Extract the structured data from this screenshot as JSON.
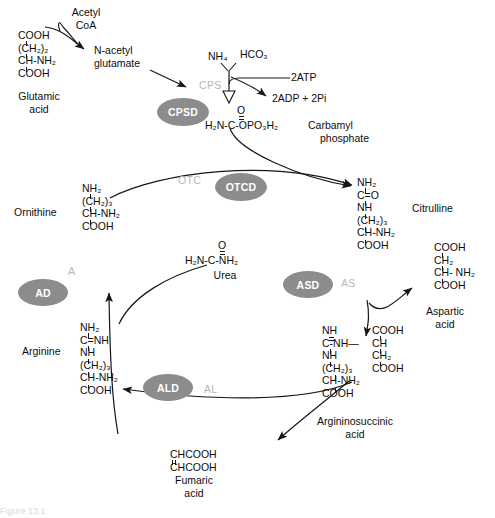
{
  "figure": {
    "caption_partial": "Figure 13.1"
  },
  "colors": {
    "enzyme_pill_fill": "#8c8c8c",
    "enzyme_pill_text": "#ffffff",
    "enzyme_plain_text": "#b6b6b6",
    "ink": "#0d0d0d",
    "background": "#ffffff"
  },
  "metabolites": {
    "acetyl_coa": {
      "line1": "Acetyl",
      "line2": "CoA"
    },
    "glutamic_acid": {
      "name_line1": "Glutamic",
      "name_line2": "acid",
      "formula": [
        "COOH",
        "(CH2)2",
        "CH-NH2",
        "COOH"
      ],
      "formula_display": [
        "COOH",
        "(CH₂)₂",
        "CH-NH₂",
        "COOH"
      ]
    },
    "n_acetyl_glutamate": {
      "line1": "N-acetyl",
      "line2": "glutamate"
    },
    "ammonium": "NH4",
    "ammonium_display": "NH₄",
    "bicarbonate": "HCO3",
    "bicarbonate_display": "HCO₃",
    "atp_in": "2ATP",
    "adp_pi_out": "2ADP + 2Pi",
    "carbamyl_phosphate": {
      "name_line1": "Carbamyl",
      "name_line2": "phosphate",
      "top_atom": "O",
      "formula": "H2N-C-OPO3H2",
      "formula_display": "H₂N-C-OPO₃H₂"
    },
    "ornithine": {
      "name": "Ornithine",
      "formula": [
        "NH2",
        "(CH2)3",
        "CH-NH2",
        "COOH"
      ],
      "formula_display": [
        "NH₂",
        "(CH₂)₃",
        "CH-NH₂",
        "COOH"
      ]
    },
    "citrulline": {
      "name": "Citrulline",
      "formula": [
        "NH2",
        "C=O",
        "NH",
        "(CH2)3",
        "CH-NH2",
        "COOH"
      ],
      "formula_display": [
        "NH₂",
        "C=O",
        "NH",
        "(CH₂)₃",
        "CH-NH₂",
        "COOH"
      ]
    },
    "urea": {
      "name": "Urea",
      "top_atom": "O",
      "formula": "H2N-C-NH2",
      "formula_display": "H₂N-C-NH₂"
    },
    "aspartic_acid": {
      "name_line1": "Aspartic",
      "name_line2": "acid",
      "formula": [
        "COOH",
        "CH2",
        "CH- NH2",
        "COOH"
      ],
      "formula_display": [
        "COOH",
        "CH₂",
        "CH- NH₂",
        "COOH"
      ]
    },
    "arginine": {
      "name": "Arginine",
      "formula": [
        "NH2",
        "C=NH",
        "NH",
        "(CH2)3",
        "CH-NH2",
        "COOH"
      ],
      "formula_display": [
        "NH₂",
        "C=NH",
        "NH",
        "(CH₂)₃",
        "CH-NH₂",
        "COOH"
      ]
    },
    "argininosuccinic_acid": {
      "name_line1": "Argininosuccinic",
      "name_line2": "acid",
      "left_column": [
        "NH",
        "C-NH—",
        "NH",
        "(CH2)3",
        "CH-NH2",
        "COOH"
      ],
      "left_column_display": [
        "NH",
        "C-NH—",
        "NH",
        "(CH₂)₃",
        "CH-NH₂",
        "COOH"
      ],
      "right_column": [
        "COOH",
        "CH",
        "CH2",
        "COOH"
      ],
      "right_column_display": [
        "COOH",
        "CH",
        "CH₂",
        "COOH"
      ]
    },
    "fumaric_acid": {
      "name_line1": "Fumaric",
      "name_line2": "acid",
      "formula": [
        "CHCOOH",
        "CHCOOH"
      ],
      "formula_display": [
        "CHCOOH",
        "CHCOOH"
      ]
    }
  },
  "enzymes": [
    {
      "id": "cps",
      "label": "CPS",
      "style": "plain"
    },
    {
      "id": "cpsd",
      "label": "CPSD",
      "style": "pill"
    },
    {
      "id": "otc",
      "label": "OTC",
      "style": "plain"
    },
    {
      "id": "otcd",
      "label": "OTCD",
      "style": "pill"
    },
    {
      "id": "as",
      "label": "AS",
      "style": "plain"
    },
    {
      "id": "asd",
      "label": "ASD",
      "style": "pill"
    },
    {
      "id": "al",
      "label": "AL",
      "style": "plain"
    },
    {
      "id": "ald",
      "label": "ALD",
      "style": "pill"
    },
    {
      "id": "a",
      "label": "A",
      "style": "plain"
    },
    {
      "id": "ad",
      "label": "AD",
      "style": "pill"
    }
  ]
}
